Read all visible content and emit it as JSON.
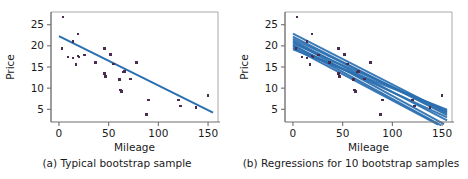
{
  "figure": {
    "background_color": "#ffffff",
    "marker_color": "#4a2c50",
    "line_color": "#2a6fb0",
    "axis_color": "#6f6f70",
    "frame_color": "#a9a9ab",
    "text_color": "#1b1b1b"
  },
  "chart_data": [
    {
      "type": "scatter",
      "panel_label": "(a)",
      "title": "(a) Typical bootstrap sample",
      "xlabel": "Mileage",
      "ylabel": "Price",
      "xlim": [
        -8,
        160
      ],
      "ylim": [
        2,
        28
      ],
      "xticks": [
        0,
        50,
        100,
        150
      ],
      "xticklabels": [
        "0",
        "50",
        "100",
        "150"
      ],
      "yticks": [
        5,
        10,
        15,
        20,
        25
      ],
      "yticklabels": [
        "5",
        "10",
        "15",
        "20",
        "25"
      ],
      "grid": false,
      "legend": "none",
      "marker": "square",
      "points": [
        [
          4,
          26.8
        ],
        [
          3,
          19.4
        ],
        [
          9,
          17.4
        ],
        [
          14,
          21.0
        ],
        [
          14,
          17.1
        ],
        [
          17,
          15.6
        ],
        [
          19,
          22.8
        ],
        [
          19,
          17.6
        ],
        [
          20,
          17.4
        ],
        [
          26,
          17.8
        ],
        [
          37,
          16.0
        ],
        [
          46,
          19.4
        ],
        [
          46,
          13.4
        ],
        [
          47,
          12.8
        ],
        [
          52,
          18.0
        ],
        [
          55,
          15.7
        ],
        [
          61,
          12.0
        ],
        [
          62,
          9.6
        ],
        [
          63,
          9.2
        ],
        [
          65,
          13.8
        ],
        [
          66,
          13.9
        ],
        [
          72,
          12.2
        ],
        [
          78,
          16.0
        ],
        [
          88,
          3.8
        ],
        [
          90,
          7.2
        ],
        [
          120,
          7.2
        ],
        [
          122,
          5.8
        ],
        [
          138,
          5.4
        ],
        [
          150,
          8.3
        ]
      ],
      "fit_line": {
        "label": "least-squares fit",
        "x": [
          0,
          155
        ],
        "y": [
          22.3,
          4.2
        ]
      }
    },
    {
      "type": "scatter",
      "panel_label": "(b)",
      "title": "(b) Regressions for 10 bootstrap samples",
      "xlabel": "Mileage",
      "ylabel": "Price",
      "xlim": [
        -8,
        160
      ],
      "ylim": [
        2,
        28
      ],
      "xticks": [
        0,
        50,
        100,
        150
      ],
      "xticklabels": [
        "0",
        "50",
        "100",
        "150"
      ],
      "yticks": [
        5,
        10,
        15,
        20,
        25
      ],
      "yticklabels": [
        "5",
        "10",
        "15",
        "20",
        "25"
      ],
      "grid": false,
      "legend": "none",
      "marker": "square",
      "points": [
        [
          4,
          26.8
        ],
        [
          3,
          19.4
        ],
        [
          9,
          17.4
        ],
        [
          14,
          21.0
        ],
        [
          14,
          17.1
        ],
        [
          17,
          15.6
        ],
        [
          19,
          22.8
        ],
        [
          19,
          17.6
        ],
        [
          20,
          17.4
        ],
        [
          26,
          17.8
        ],
        [
          37,
          16.0
        ],
        [
          46,
          19.4
        ],
        [
          46,
          13.4
        ],
        [
          47,
          12.8
        ],
        [
          52,
          18.0
        ],
        [
          55,
          15.7
        ],
        [
          61,
          12.0
        ],
        [
          62,
          9.6
        ],
        [
          63,
          9.2
        ],
        [
          65,
          13.8
        ],
        [
          66,
          13.9
        ],
        [
          72,
          12.2
        ],
        [
          78,
          16.0
        ],
        [
          88,
          3.8
        ],
        [
          90,
          7.2
        ],
        [
          120,
          7.2
        ],
        [
          122,
          5.8
        ],
        [
          138,
          5.4
        ],
        [
          150,
          8.3
        ]
      ],
      "bootstrap_lines": [
        {
          "name": "sample 1",
          "intercept": 22.9,
          "x_end": 155,
          "y_end": 4.3
        },
        {
          "name": "sample 2",
          "intercept": 22.2,
          "x_end": 155,
          "y_end": 3.6
        },
        {
          "name": "sample 3",
          "intercept": 21.7,
          "x_end": 155,
          "y_end": 4.0
        },
        {
          "name": "sample 4",
          "intercept": 21.3,
          "x_end": 155,
          "y_end": 2.4
        },
        {
          "name": "sample 5",
          "intercept": 21.0,
          "x_end": 152,
          "y_end": 1.5
        },
        {
          "name": "sample 6",
          "intercept": 20.6,
          "x_end": 155,
          "y_end": 4.6
        },
        {
          "name": "sample 7",
          "intercept": 20.2,
          "x_end": 149,
          "y_end": 1.2
        },
        {
          "name": "sample 8",
          "intercept": 19.9,
          "x_end": 155,
          "y_end": 3.1
        },
        {
          "name": "sample 9",
          "intercept": 19.5,
          "x_end": 146,
          "y_end": 1.4
        },
        {
          "name": "sample 10",
          "intercept": 19.2,
          "x_end": 155,
          "y_end": 4.9
        }
      ]
    }
  ]
}
